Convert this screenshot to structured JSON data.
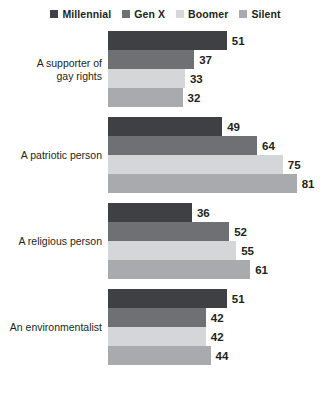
{
  "chart_data": {
    "type": "bar",
    "orientation": "horizontal",
    "grouped": true,
    "title": "",
    "subtitle": "",
    "xlabel": "",
    "ylabel": "",
    "xlim": [
      0,
      81
    ],
    "grid": false,
    "legend_position": "top-center",
    "categories": [
      "A supporter of gay rights",
      "A patriotic person",
      "A religious person",
      "An environmentalist"
    ],
    "category_lines": [
      [
        "A supporter of",
        "gay rights"
      ],
      [
        "A patriotic person"
      ],
      [
        "A religious person"
      ],
      [
        "An environmentalist"
      ]
    ],
    "series": [
      {
        "name": "Millennial",
        "color": "#3f4044",
        "values": [
          51,
          49,
          36,
          51
        ]
      },
      {
        "name": "Gen X",
        "color": "#6e7074",
        "values": [
          37,
          64,
          52,
          42
        ]
      },
      {
        "name": "Boomer",
        "color": "#d5d6d8",
        "values": [
          33,
          75,
          55,
          42
        ]
      },
      {
        "name": "Silent",
        "color": "#a8aaad",
        "values": [
          32,
          81,
          61,
          44
        ]
      }
    ]
  }
}
